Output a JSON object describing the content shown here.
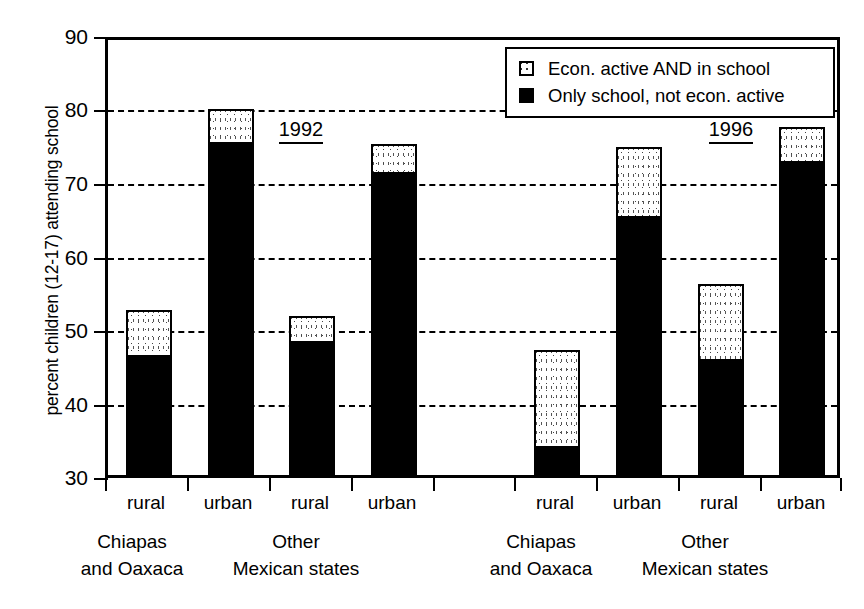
{
  "chart_data": {
    "type": "bar",
    "title": "",
    "subtitle": "",
    "xlabel": "",
    "ylabel": "percent children (12-17) attending school",
    "ylim": [
      30,
      90
    ],
    "yticks": [
      30,
      40,
      50,
      60,
      70,
      80,
      90
    ],
    "grid": "horizontal dashed gridlines at each y tick",
    "stacked": true,
    "legend_position": "top-right inside plot area",
    "series": [
      {
        "name": "Only school, not econ. active",
        "key": "only_school",
        "color": "#000000",
        "fill": "solid-black",
        "values": [
          46.0,
          75.0,
          48.0,
          71.0,
          33.7,
          65.0,
          45.5,
          72.4
        ]
      },
      {
        "name": "Econ. active AND in school",
        "key": "active_and_school",
        "color": "#ffffff",
        "fill": "white-dotted",
        "values": [
          6.5,
          4.8,
          3.7,
          4.0,
          13.3,
          9.6,
          10.5,
          4.9
        ]
      }
    ],
    "totals": [
      52.5,
      79.8,
      51.7,
      75.0,
      47.0,
      74.6,
      56.0,
      77.3
    ],
    "categories": [
      "rural",
      "urban",
      "rural",
      "urban",
      "rural",
      "urban",
      "rural",
      "urban"
    ],
    "bars": [
      {
        "period": "1992",
        "region": "Chiapas and Oaxaca",
        "locality": "rural",
        "only_school": 46.0,
        "active_and_school": 6.5,
        "total": 52.5
      },
      {
        "period": "1992",
        "region": "Chiapas and Oaxaca",
        "locality": "urban",
        "only_school": 75.0,
        "active_and_school": 4.8,
        "total": 79.8
      },
      {
        "period": "1992",
        "region": "Other Mexican states",
        "locality": "rural",
        "only_school": 48.0,
        "active_and_school": 3.7,
        "total": 51.7
      },
      {
        "period": "1992",
        "region": "Other Mexican states",
        "locality": "urban",
        "only_school": 71.0,
        "active_and_school": 4.0,
        "total": 75.0
      },
      {
        "period": "1996",
        "region": "Chiapas and Oaxaca",
        "locality": "rural",
        "only_school": 33.7,
        "active_and_school": 13.3,
        "total": 47.0
      },
      {
        "period": "1996",
        "region": "Chiapas and Oaxaca",
        "locality": "urban",
        "only_school": 65.0,
        "active_and_school": 9.6,
        "total": 74.6
      },
      {
        "period": "1996",
        "region": "Other Mexican states",
        "locality": "rural",
        "only_school": 45.5,
        "active_and_school": 10.5,
        "total": 56.0
      },
      {
        "period": "1996",
        "region": "Other Mexican states",
        "locality": "urban",
        "only_school": 72.4,
        "active_and_school": 4.9,
        "total": 77.3
      }
    ]
  },
  "axes": {
    "y_title": "percent children (12-17) attending school",
    "y_tick_labels": [
      "90",
      "80",
      "70",
      "60",
      "50",
      "40",
      "30"
    ],
    "x_tick_labels": [
      "rural",
      "urban",
      "rural",
      "urban",
      "rural",
      "urban",
      "rural",
      "urban"
    ],
    "x_group_labels": [
      {
        "line1": "Chiapas",
        "line2": "and Oaxaca"
      },
      {
        "line1": "Other",
        "line2": "Mexican states"
      },
      {
        "line1": "Chiapas",
        "line2": "and Oaxaca"
      },
      {
        "line1": "Other",
        "line2": "Mexican states"
      }
    ]
  },
  "annotations": {
    "period_labels": [
      "1992",
      "1996"
    ]
  },
  "legend": {
    "items": [
      {
        "label": "Econ. active AND in school",
        "swatch": "white-dotted-square"
      },
      {
        "label": "Only school, not econ. active",
        "swatch": "solid-black-square"
      }
    ]
  },
  "colors": {
    "ink": "#000000",
    "background": "#ffffff"
  }
}
